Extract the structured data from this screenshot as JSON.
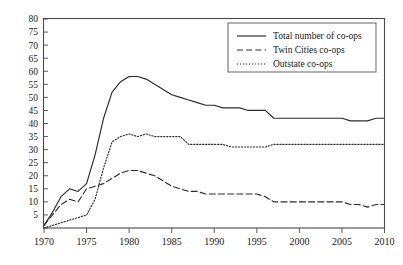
{
  "chart_data": {
    "type": "line",
    "title": "",
    "subtitle": "",
    "xlabel": "",
    "ylabel": "",
    "xlim": [
      1970,
      2010
    ],
    "ylim": [
      0,
      80
    ],
    "grid": false,
    "legend_position": "upper-right-inside",
    "y_ticks": [
      0,
      5,
      10,
      15,
      20,
      25,
      30,
      35,
      40,
      45,
      50,
      55,
      60,
      65,
      70,
      75,
      80
    ],
    "y_tick_labels": [
      "",
      "5",
      "10",
      "15",
      "20",
      "25",
      "30",
      "35",
      "40",
      "45",
      "50",
      "55",
      "60",
      "65",
      "70",
      "75",
      "80"
    ],
    "x_ticks": [
      1970,
      1975,
      1980,
      1985,
      1990,
      1995,
      2000,
      2005,
      2010
    ],
    "x_tick_labels": [
      "1970",
      "1975",
      "1980",
      "1985",
      "1990",
      "1995",
      "2000",
      "2005",
      "2010"
    ],
    "x": [
      1970,
      1971,
      1972,
      1973,
      1974,
      1975,
      1976,
      1977,
      1978,
      1979,
      1980,
      1981,
      1982,
      1983,
      1984,
      1985,
      1986,
      1987,
      1988,
      1989,
      1990,
      1991,
      1992,
      1993,
      1994,
      1995,
      1996,
      1997,
      1998,
      1999,
      2000,
      2001,
      2002,
      2003,
      2004,
      2005,
      2006,
      2007,
      2008,
      2009,
      2010
    ],
    "series": [
      {
        "name": "Total number of co-ops",
        "style": "solid",
        "color": "#2b2b2b",
        "values": [
          1,
          6,
          12,
          15,
          14,
          17,
          28,
          42,
          52,
          56,
          58,
          58,
          57,
          55,
          53,
          51,
          50,
          49,
          48,
          47,
          47,
          46,
          46,
          46,
          45,
          45,
          45,
          42,
          42,
          42,
          42,
          42,
          42,
          42,
          42,
          42,
          41,
          41,
          41,
          42,
          42
        ]
      },
      {
        "name": "Twin Cities co-ops",
        "style": "dashed",
        "color": "#2b2b2b",
        "values": [
          1,
          5,
          9,
          11,
          10,
          15,
          16,
          17,
          19,
          21,
          22,
          22,
          21,
          20,
          18,
          16,
          15,
          14,
          14,
          13,
          13,
          13,
          13,
          13,
          13,
          13,
          12,
          10,
          10,
          10,
          10,
          10,
          10,
          10,
          10,
          10,
          9,
          9,
          8,
          9,
          9
        ]
      },
      {
        "name": "Outstate co-ops",
        "style": "dotted",
        "color": "#2b2b2b",
        "values": [
          0,
          1,
          2,
          3,
          4,
          5,
          11,
          23,
          33,
          35,
          36,
          35,
          36,
          35,
          35,
          35,
          35,
          32,
          32,
          32,
          32,
          32,
          31,
          31,
          31,
          31,
          31,
          32,
          32,
          32,
          32,
          32,
          32,
          32,
          32,
          32,
          32,
          32,
          32,
          32,
          32
        ]
      }
    ]
  },
  "legend": {
    "items": [
      {
        "label": "Total number of co-ops",
        "style": "solid"
      },
      {
        "label": "Twin Cities co-ops",
        "style": "dashed"
      },
      {
        "label": "Outstate co-ops",
        "style": "dotted"
      }
    ]
  }
}
